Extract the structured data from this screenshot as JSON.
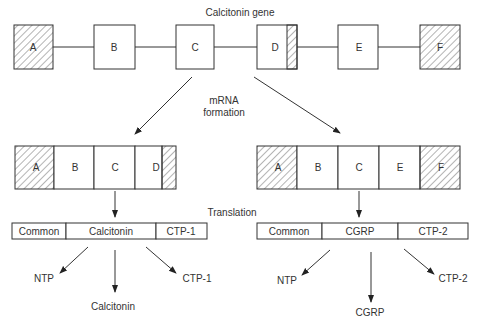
{
  "title": "Calcitonin gene",
  "gene": {
    "exons": [
      {
        "label": "A",
        "hatched": true
      },
      {
        "label": "B",
        "hatched": false
      },
      {
        "label": "C",
        "hatched": false
      },
      {
        "label": "D",
        "hatched": "partial-right"
      },
      {
        "label": "E",
        "hatched": false
      },
      {
        "label": "F",
        "hatched": true
      }
    ]
  },
  "mrna_label": [
    "mRNA",
    "formation"
  ],
  "translation_label": "Translation",
  "left_branch": {
    "mrna": [
      "A",
      "B",
      "C",
      "D"
    ],
    "protein": [
      "Common",
      "Calcitonin",
      "CTP-1"
    ],
    "products": [
      "NTP",
      "Calcitonin",
      "CTP-1"
    ]
  },
  "right_branch": {
    "mrna": [
      "A",
      "B",
      "C",
      "E",
      "F"
    ],
    "protein": [
      "Common",
      "CGRP",
      "CTP-2"
    ],
    "products": [
      "NTP",
      "CGRP",
      "CTP-2"
    ]
  }
}
